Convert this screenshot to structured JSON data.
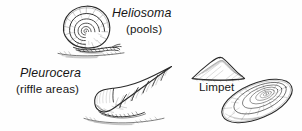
{
  "figure": {
    "medium": "pen-and-ink line drawing",
    "background_color": "#fefefe",
    "ink_color": "#1c1c1c"
  },
  "labels": {
    "heliosoma": {
      "scientific": "Heliosoma",
      "habitat": "(pools)"
    },
    "pleurocera": {
      "scientific": "Pleurocera",
      "habitat": "(riffle areas)"
    },
    "limpet": {
      "common": "Limpet"
    }
  },
  "specimens": [
    {
      "name": "heliosoma-snail",
      "shell_form": "flat coiled planorbid spiral with radial growth hatching",
      "orientation": "spiral face toward viewer, body foot extending right along substrate"
    },
    {
      "name": "pleurocera-snail",
      "shell_form": "elongated conical turreted shell with stepped whorls",
      "orientation": "apex pointing upper-right, aperture lower-left, dark foot beneath"
    },
    {
      "name": "limpet-side-view",
      "shell_form": "low conical dome with flat base and concentric ridges"
    },
    {
      "name": "limpet-top-view",
      "shell_form": "oval cap with concentric rings around off-center apex",
      "orientation": "tilted diagonally"
    }
  ]
}
